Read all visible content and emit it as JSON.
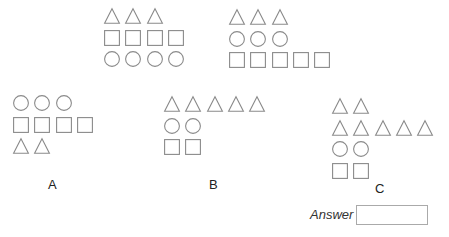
{
  "puzzle": {
    "examples": [
      {
        "id": "example-1",
        "rows": [
          [
            "triangle",
            "triangle",
            "triangle"
          ],
          [
            "square",
            "square",
            "square",
            "square"
          ],
          [
            "circle",
            "circle",
            "circle",
            "circle"
          ]
        ]
      },
      {
        "id": "example-2",
        "rows": [
          [
            "triangle",
            "triangle",
            "triangle"
          ],
          [
            "circle",
            "circle",
            "circle"
          ],
          [
            "square",
            "square",
            "square",
            "square",
            "square"
          ]
        ]
      }
    ],
    "options": [
      {
        "label": "A",
        "rows": [
          [
            "circle",
            "circle",
            "circle"
          ],
          [
            "square",
            "square",
            "square",
            "square"
          ],
          [
            "triangle",
            "triangle"
          ]
        ]
      },
      {
        "label": "B",
        "rows": [
          [
            "triangle",
            "triangle",
            "triangle",
            "triangle",
            "triangle"
          ],
          [
            "circle",
            "circle"
          ],
          [
            "square",
            "square"
          ]
        ]
      },
      {
        "label": "C",
        "rows": [
          [
            "triangle",
            "triangle"
          ],
          [
            "triangle",
            "triangle",
            "triangle",
            "triangle",
            "triangle"
          ],
          [
            "circle",
            "circle"
          ],
          [
            "square",
            "square"
          ]
        ]
      }
    ],
    "answer": {
      "label": "Answer",
      "value": ""
    }
  },
  "colors": {
    "stroke": "#8a8a8a"
  }
}
